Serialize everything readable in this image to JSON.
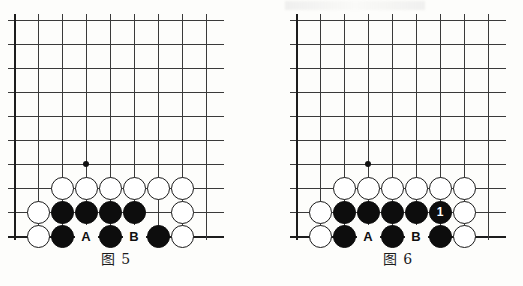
{
  "page": {
    "background_color": "#fdfdfb",
    "line_color": "#3a3a3a",
    "edge_color": "#1d1d1d",
    "black_stone_color": "#0d0d0d",
    "white_stone_color": "#ffffff",
    "stone_outline_color": "#1a1a1a"
  },
  "figures": [
    {
      "id": "figure-5",
      "caption": "图 5",
      "board": {
        "columns": 9,
        "rows": 10,
        "cell": 24,
        "left_edge": true,
        "bottom_edge": true,
        "star_point": {
          "col": 3,
          "row": 6
        },
        "stones": [
          {
            "color": "white",
            "col": 2,
            "row": 7,
            "label": ""
          },
          {
            "color": "white",
            "col": 3,
            "row": 7,
            "label": ""
          },
          {
            "color": "white",
            "col": 4,
            "row": 7,
            "label": ""
          },
          {
            "color": "white",
            "col": 5,
            "row": 7,
            "label": ""
          },
          {
            "color": "white",
            "col": 6,
            "row": 7,
            "label": ""
          },
          {
            "color": "white",
            "col": 7,
            "row": 7,
            "label": ""
          },
          {
            "color": "white",
            "col": 1,
            "row": 8,
            "label": ""
          },
          {
            "color": "black",
            "col": 2,
            "row": 8,
            "label": ""
          },
          {
            "color": "black",
            "col": 3,
            "row": 8,
            "label": ""
          },
          {
            "color": "black",
            "col": 4,
            "row": 8,
            "label": ""
          },
          {
            "color": "black",
            "col": 5,
            "row": 8,
            "label": ""
          },
          {
            "color": "white",
            "col": 7,
            "row": 8,
            "label": ""
          },
          {
            "color": "white",
            "col": 1,
            "row": 9,
            "label": ""
          },
          {
            "color": "black",
            "col": 2,
            "row": 9,
            "label": ""
          },
          {
            "color": "black",
            "col": 4,
            "row": 9,
            "label": ""
          },
          {
            "color": "black",
            "col": 6,
            "row": 9,
            "label": ""
          },
          {
            "color": "white",
            "col": 7,
            "row": 9,
            "label": ""
          }
        ],
        "point_labels": [
          {
            "text": "A",
            "col": 3,
            "row": 9
          },
          {
            "text": "B",
            "col": 5,
            "row": 9
          }
        ]
      }
    },
    {
      "id": "figure-6",
      "caption": "图 6",
      "board": {
        "columns": 9,
        "rows": 10,
        "cell": 24,
        "left_edge": true,
        "bottom_edge": true,
        "star_point": {
          "col": 3,
          "row": 6
        },
        "stones": [
          {
            "color": "white",
            "col": 2,
            "row": 7,
            "label": ""
          },
          {
            "color": "white",
            "col": 3,
            "row": 7,
            "label": ""
          },
          {
            "color": "white",
            "col": 4,
            "row": 7,
            "label": ""
          },
          {
            "color": "white",
            "col": 5,
            "row": 7,
            "label": ""
          },
          {
            "color": "white",
            "col": 6,
            "row": 7,
            "label": ""
          },
          {
            "color": "white",
            "col": 7,
            "row": 7,
            "label": ""
          },
          {
            "color": "white",
            "col": 1,
            "row": 8,
            "label": ""
          },
          {
            "color": "black",
            "col": 2,
            "row": 8,
            "label": ""
          },
          {
            "color": "black",
            "col": 3,
            "row": 8,
            "label": ""
          },
          {
            "color": "black",
            "col": 4,
            "row": 8,
            "label": ""
          },
          {
            "color": "black",
            "col": 5,
            "row": 8,
            "label": ""
          },
          {
            "color": "black",
            "col": 6,
            "row": 8,
            "label": "1"
          },
          {
            "color": "white",
            "col": 7,
            "row": 8,
            "label": ""
          },
          {
            "color": "white",
            "col": 1,
            "row": 9,
            "label": ""
          },
          {
            "color": "black",
            "col": 2,
            "row": 9,
            "label": ""
          },
          {
            "color": "black",
            "col": 4,
            "row": 9,
            "label": ""
          },
          {
            "color": "black",
            "col": 6,
            "row": 9,
            "label": ""
          },
          {
            "color": "white",
            "col": 7,
            "row": 9,
            "label": ""
          }
        ],
        "point_labels": [
          {
            "text": "A",
            "col": 3,
            "row": 9
          },
          {
            "text": "B",
            "col": 5,
            "row": 9
          }
        ]
      }
    }
  ]
}
